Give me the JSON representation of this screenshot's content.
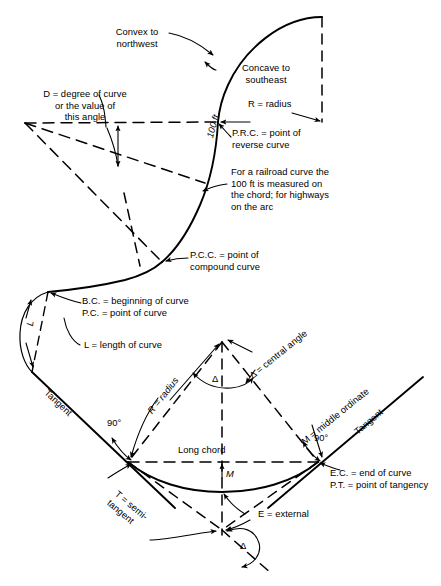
{
  "figure": {
    "stroke_color": "#000000",
    "background": "#ffffff"
  },
  "labels": {
    "convex": "Convex to\nnorthwest",
    "concave": "Concave to\nsoutheast",
    "degree_of_curve": "D = degree of curve\nor the value of\nthis angle",
    "radius_top": "R = radius",
    "prc": "P.R.C. = point of\nreverse curve",
    "hundred_ft": "100 ft",
    "railroad_note": "For a railroad curve the\n100 ft is measured on\nthe chord; for highways\non the arc",
    "pcc": "P.C.C. = point of\ncompound curve",
    "bc_pc": "B.C. = beginning of curve\nP.C. = point of curve",
    "length_of_curve": "L = length of curve",
    "l_arc": "L",
    "tangent_left": "Tangent",
    "tangent_right": "Tangent",
    "angle_90_left": "90°",
    "angle_90_right": "90°",
    "radius_main": "R = radius",
    "central_angle": "Δ = central angle",
    "delta_symbol_center": "Δ",
    "delta_symbol_bottom": "Δ",
    "middle_ordinate": "M = middle ordinate",
    "m_short": "M",
    "long_chord": "Long chord",
    "ec_pt": "E.C. = end of curve\nP.T. = point of tangency",
    "semi_tangent": "T = semi-\ntangent",
    "external": "E = external"
  },
  "geometry": {
    "prc_point": [
      218,
      122
    ],
    "upper_center": [
      25,
      123
    ],
    "upper_curve_top": [
      322,
      17
    ],
    "pcc_point": [
      162,
      262
    ],
    "bc_point": [
      48,
      292
    ],
    "curve_center": [
      222,
      342
    ],
    "bc_chord_left": [
      128,
      462
    ],
    "ec_point": [
      318,
      462
    ],
    "pi_vertex": [
      222,
      530
    ],
    "curve_low_point": [
      222,
      492
    ]
  }
}
